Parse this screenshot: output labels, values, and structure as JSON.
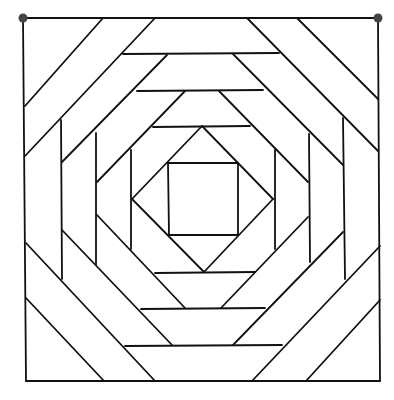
{
  "diagram": {
    "type": "geometric-line-pattern",
    "stroke_color": "#111111",
    "background_color": "#ffffff",
    "corner_dot_color": "#444444",
    "corner_dots": [
      "top-left",
      "top-right"
    ],
    "structure": {
      "outer_frame": "square",
      "center": "square inside diamond",
      "rings": 4,
      "symmetry": "4-fold rotational"
    }
  }
}
